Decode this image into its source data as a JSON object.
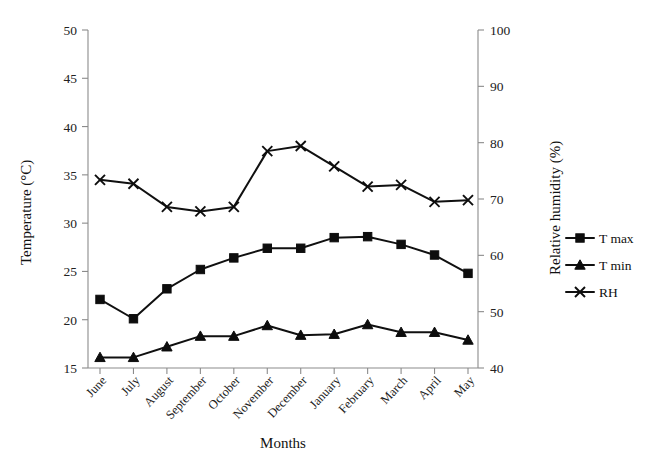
{
  "chart_data": {
    "type": "line",
    "title": "",
    "xlabel": "Months",
    "ylabel": "Temperature (°C)",
    "y2label": "Relative humidity (%)",
    "categories": [
      "June",
      "July",
      "August",
      "September",
      "October",
      "November",
      "December",
      "January",
      "February",
      "March",
      "April",
      "May"
    ],
    "ylim": [
      15,
      50
    ],
    "yticks": [
      15,
      20,
      25,
      30,
      35,
      40,
      45,
      50
    ],
    "y2lim": [
      40,
      100
    ],
    "y2ticks": [
      40,
      50,
      60,
      70,
      80,
      90,
      100
    ],
    "grid": false,
    "legend_position": "right",
    "series": [
      {
        "name": "T max",
        "axis": "left",
        "marker": "square",
        "values": [
          22.1,
          20.1,
          23.2,
          25.2,
          26.4,
          27.4,
          27.4,
          28.5,
          28.6,
          27.8,
          26.7,
          24.8
        ]
      },
      {
        "name": "T min",
        "axis": "left",
        "marker": "triangle",
        "values": [
          16.1,
          16.1,
          17.2,
          18.3,
          18.3,
          19.4,
          18.4,
          18.5,
          19.5,
          18.7,
          18.7,
          17.9
        ]
      },
      {
        "name": "RH",
        "axis": "right",
        "marker": "cross-x",
        "values": [
          73.4,
          72.7,
          68.6,
          67.8,
          68.6,
          78.5,
          79.4,
          75.8,
          72.2,
          72.5,
          69.5,
          69.8
        ]
      }
    ]
  },
  "axes": {
    "left": {
      "title": "Temperature (°C)",
      "tick_labels": [
        "15",
        "20",
        "25",
        "30",
        "35",
        "40",
        "45",
        "50"
      ]
    },
    "right": {
      "title": "Relative humidity (%)",
      "tick_labels": [
        "40",
        "50",
        "60",
        "70",
        "80",
        "90",
        "100"
      ]
    },
    "bottom": {
      "title": "Months",
      "tick_labels": [
        "June",
        "July",
        "August",
        "September",
        "October",
        "November",
        "December",
        "January",
        "February",
        "March",
        "April",
        "May"
      ]
    }
  },
  "legend": {
    "items": [
      {
        "label": "T max",
        "marker": "square"
      },
      {
        "label": "T min",
        "marker": "triangle"
      },
      {
        "label": "RH",
        "marker": "cross-x"
      }
    ]
  },
  "colors": {
    "series": "#0d0d0d",
    "axis": "#8b8b8b",
    "text": "#1a1a1a",
    "background": "#ffffff"
  }
}
